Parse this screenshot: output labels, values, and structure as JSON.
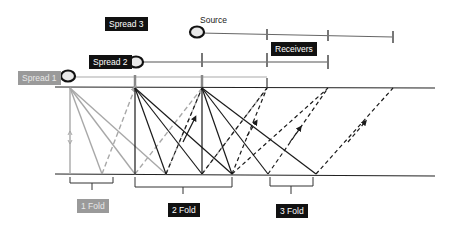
{
  "labels": {
    "spread1": "Spread 1",
    "spread2": "Spread 2",
    "spread3": "Spread 3",
    "source": "Source",
    "receivers": "Receivers",
    "fold1": "1 Fold",
    "fold2": "2 Fold",
    "fold3": "3 Fold"
  },
  "colors": {
    "spread1": "#9a9a9a",
    "spread2": "#111111",
    "spread3": "#111111",
    "surface": "#222222",
    "reflector": "#222222",
    "ray_gray": "#a8a8a8",
    "ray_black": "#1a1a1a"
  },
  "geometry": {
    "surface_y": 87,
    "reflector_y": 174,
    "shot_points_x": [
      70,
      135,
      202,
      267
    ],
    "spread_lines": [
      {
        "name": "Spread 1",
        "y": 77,
        "x_start": 70,
        "x_end": 267,
        "ticks": [
          135,
          202,
          267
        ]
      },
      {
        "name": "Spread 2",
        "y": 62,
        "x_start": 135,
        "x_end": 328,
        "ticks": [
          202,
          267,
          328
        ]
      },
      {
        "name": "Spread 3",
        "y": 34,
        "x_start": 200,
        "x_end": 393,
        "ticks": [
          267,
          328,
          393
        ]
      }
    ],
    "fold_brackets": [
      {
        "label": "1 Fold",
        "x_start": 70,
        "x_end": 113
      },
      {
        "label": "2 Fold",
        "x_start": 135,
        "x_end": 232
      },
      {
        "label": "3 Fold",
        "x_start": 270,
        "x_end": 313
      }
    ]
  }
}
